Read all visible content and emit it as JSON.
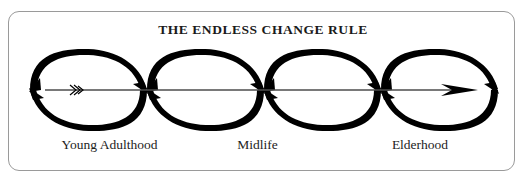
{
  "figure": {
    "title": "THE ENDLESS CHANGE RULE",
    "frame": {
      "shape": "rounded-rectangle",
      "border_color": "#9a9a9a"
    },
    "ink_color": "#000000",
    "background_color": "#ffffff"
  },
  "stage_labels": [
    {
      "id": "young-adulthood",
      "text": "Young Adulthood"
    },
    {
      "id": "midlife",
      "text": "Midlife"
    },
    {
      "id": "elderhood",
      "text": "Elderhood"
    }
  ],
  "diagram": {
    "type": "cyclical-progression",
    "axis_arrow": {
      "direction": "left-to-right",
      "tail_marking": "fletching-chevrons",
      "head": "solid-triangle"
    },
    "lens_count": 5,
    "vertices_x": [
      30,
      147,
      264,
      381,
      498
    ],
    "axis_y": 90,
    "lens_top_y": 50,
    "lens_bottom_y": 130,
    "arc_pairs": [
      {
        "upper": "thick-at-left tapering right, arrowhead at right vertex",
        "lower": "thick-at-right tapering left, arrowhead at left vertex"
      }
    ]
  }
}
